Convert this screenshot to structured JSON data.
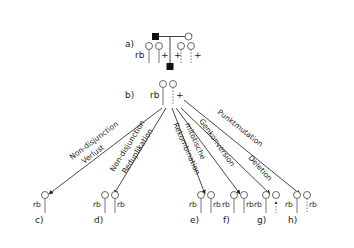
{
  "panels": {
    "a": {
      "label": "a)",
      "allele_mut": "rb",
      "allele_wt": "+"
    },
    "b": {
      "label": "b)",
      "allele_mut": "rb",
      "allele_wt": "+"
    },
    "c": {
      "label": "c)",
      "alleles": [
        "rb"
      ]
    },
    "d": {
      "label": "d)",
      "alleles": [
        "rb",
        "rb"
      ]
    },
    "e": {
      "label": "e)",
      "alleles": [
        "rb",
        "rb"
      ]
    },
    "f": {
      "label": "f)",
      "alleles": [
        "rb",
        "rb"
      ]
    },
    "g": {
      "label": "g)",
      "alleles": [
        "rb"
      ]
    },
    "h": {
      "label": "h)",
      "alleles": [
        "rb",
        "rb"
      ]
    }
  },
  "mechanisms": [
    {
      "id": "c",
      "line1": "Non-disjunction",
      "line2": "Verlust"
    },
    {
      "id": "d",
      "line1": "Non-disjunction",
      "line2": "Reduplikation"
    },
    {
      "id": "e",
      "line1": "mitotische",
      "line2": "Rekombination"
    },
    {
      "id": "f",
      "line1": "Genkonversion",
      "line2": ""
    },
    {
      "id": "g",
      "line1": "Deletion",
      "line2": ""
    },
    {
      "id": "h",
      "line1": "Punktmutation",
      "line2": ""
    }
  ]
}
